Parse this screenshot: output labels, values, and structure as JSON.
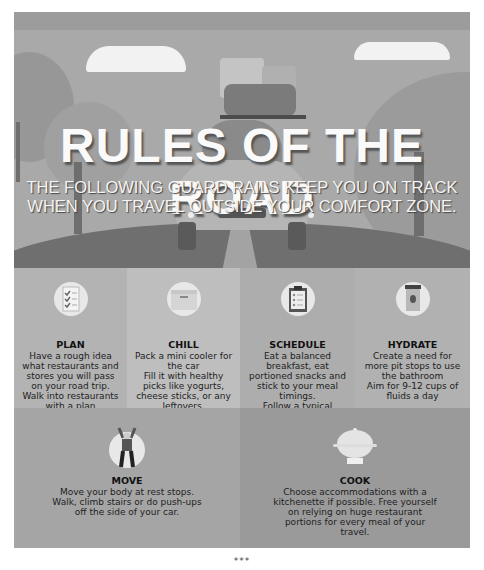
{
  "hero": {
    "title": "RULES OF THE ROAD",
    "subtitle": "THE FOLLOWING GUARD RAILS KEEP YOU ON TRACK WHEN YOU TRAVEL OUTSIDE YOUR COMFORT ZONE."
  },
  "rules": [
    {
      "icon": "checklist-icon",
      "title": "PLAN",
      "text": "Have a rough idea what restaurants and stores you will pass on your road trip.\nWalk into restaurants with a plan"
    },
    {
      "icon": "cooler-icon",
      "title": "CHILL",
      "text": "Pack a mini cooler for the car\nFill it with healthy picks like yogurts, cheese sticks, or any leftovers."
    },
    {
      "icon": "clipboard-icon",
      "title": "SCHEDULE",
      "text": "Eat a balanced breakfast, eat portioned snacks and stick to your meal timings.\nFollow a typical schedule to avoid plowing through your stash"
    },
    {
      "icon": "water-jug-icon",
      "title": "HYDRATE",
      "text": "Create a need for more pit stops to use the bathroom\nAim for 9-12 cups of fluids a day"
    },
    {
      "icon": "person-exercise-icon",
      "title": "MOVE",
      "text": "Move your body at rest stops.\nWalk, climb stairs or do push-ups off the side of your car."
    },
    {
      "icon": "cooking-pot-icon",
      "title": "COOK",
      "text": "Choose accommodations with a kitchenette if possible. Free yourself on relying on huge restaurant portions for every meal of your travel."
    }
  ],
  "footer": {
    "separator": "***"
  }
}
